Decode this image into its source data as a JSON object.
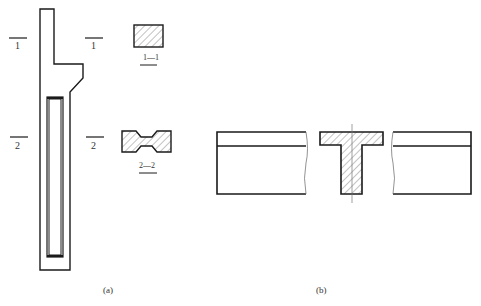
{
  "figure_a": {
    "caption": "(a)",
    "section_marks": {
      "left_1": "1",
      "right_1": "1",
      "left_2": "2",
      "right_2": "2"
    },
    "section_1_label": "1—1",
    "section_2_label": "2—2"
  },
  "figure_b": {
    "caption": "(b)"
  },
  "colors": {
    "line": "#1a1a1a",
    "hatch": "#555555",
    "background": "#ffffff"
  }
}
